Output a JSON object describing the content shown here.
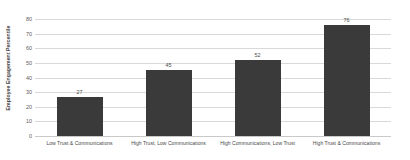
{
  "chart_data": {
    "type": "bar",
    "title": "",
    "xlabel": "",
    "ylabel": "Employee Engagement Percentile",
    "ylim": [
      0,
      80
    ],
    "ytick_labels": [
      "80",
      "70",
      "60",
      "50",
      "40",
      "30",
      "20",
      "10",
      "0"
    ],
    "yticks": [
      80,
      70,
      60,
      50,
      40,
      30,
      20,
      10,
      0
    ],
    "grid": true,
    "legend": null,
    "bar_color": "#3a3a3a",
    "categories": [
      "Low Trust & Communications",
      "High Trust, Low Communications",
      "High Communications, Low Trust",
      "High Trust & Communications"
    ],
    "values": [
      27,
      45,
      52,
      76
    ],
    "value_labels": [
      "27",
      "45",
      "52",
      "76"
    ]
  }
}
